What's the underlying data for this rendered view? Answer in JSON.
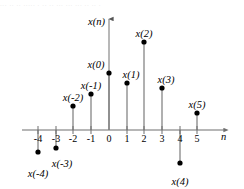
{
  "figure": {
    "width": 244,
    "height": 189,
    "background": "#ffffff",
    "top_artifact_text": "... .. .. ..... . .. .. ... ... ... .. .. .",
    "axis_color": "#6f6f6f",
    "stem_color": "#6f6f6f",
    "marker_color": "#000000",
    "text_color": "#000000"
  },
  "axes": {
    "x_axis_label": "n",
    "y_axis_label": "x(n)",
    "x_axis_label_name": "n-axis-label",
    "y_axis_label_name": "x-of-n-axis-label",
    "tick_labels": [
      "-4",
      "-3",
      "-2",
      "-1",
      "0",
      "1",
      "2",
      "3",
      "4",
      "5"
    ],
    "origin_n": 0
  },
  "chart_data": {
    "type": "scatter",
    "title": "",
    "subtitle": "",
    "xlabel": "n",
    "ylabel": "x(n)",
    "grid": false,
    "legend": "none",
    "x": [
      -4,
      -3,
      -2,
      -1,
      0,
      1,
      2,
      3,
      4,
      5
    ],
    "values": [
      -1.3,
      -1.1,
      1.4,
      2.1,
      3.3,
      2.7,
      5.1,
      2.4,
      -1.9,
      1.0
    ],
    "categories": [
      "-4",
      "-3",
      "-2",
      "-1",
      "0",
      "1",
      "2",
      "3",
      "4",
      "5"
    ],
    "point_labels": [
      "x(-4)",
      "x(-3)",
      "x(-2)",
      "x(-1)",
      "x(0)",
      "x(1)",
      "x(2)",
      "x(3)",
      "x(4)",
      "x(5)"
    ],
    "xlim": [
      -4.9,
      6.7
    ],
    "ylim": [
      -2.4,
      6.6
    ],
    "annotations": [
      {
        "text": "x(-4)",
        "n": -4,
        "placement": "below"
      },
      {
        "text": "x(-3)",
        "n": -3,
        "placement": "below-right"
      },
      {
        "text": "x(-2)",
        "n": -2,
        "placement": "above"
      },
      {
        "text": "x(-1)",
        "n": -1,
        "placement": "above"
      },
      {
        "text": "x(0)",
        "n": 0,
        "placement": "above-left"
      },
      {
        "text": "x(1)",
        "n": 1,
        "placement": "above"
      },
      {
        "text": "x(2)",
        "n": 2,
        "placement": "above"
      },
      {
        "text": "x(3)",
        "n": 3,
        "placement": "above"
      },
      {
        "text": "x(4)",
        "n": 4,
        "placement": "below"
      },
      {
        "text": "x(5)",
        "n": 5,
        "placement": "above"
      }
    ]
  },
  "geometry": {
    "axis_y_px": 130,
    "axis_x_left_px": 22,
    "axis_x_right_px": 230,
    "y_axis_x_px": 109,
    "y_axis_top_px": 14,
    "tick_spacing_px": 17.8,
    "tick_half_height_px": 4,
    "marker_radius_px": 2.6,
    "tick_positions_px": [
      38,
      56,
      73,
      91,
      109,
      127,
      144,
      162,
      180,
      197
    ],
    "sample_tip_y_px": [
      152,
      148,
      106,
      94,
      73,
      83,
      42,
      88,
      163,
      113
    ],
    "label_positions_px": [
      {
        "x": 38,
        "y": 168
      },
      {
        "x": 62,
        "y": 158
      },
      {
        "x": 73,
        "y": 92
      },
      {
        "x": 91,
        "y": 80
      },
      {
        "x": 96,
        "y": 59
      },
      {
        "x": 131,
        "y": 69
      },
      {
        "x": 144,
        "y": 28
      },
      {
        "x": 166,
        "y": 74
      },
      {
        "x": 180,
        "y": 176
      },
      {
        "x": 197,
        "y": 99
      }
    ],
    "tick_label_y_px": 133,
    "x_axis_label_px": {
      "x": 221,
      "y": 131
    },
    "y_axis_label_px": {
      "x": 88,
      "y": 16
    }
  }
}
